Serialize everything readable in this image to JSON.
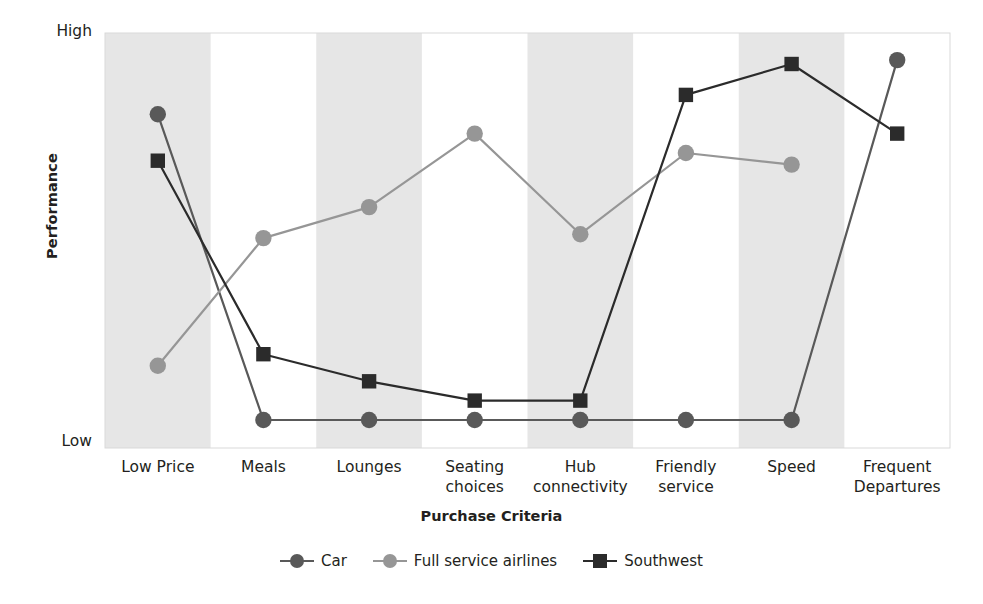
{
  "axes": {
    "ylabel": "Performance",
    "ytick_high": "High",
    "ytick_low": "Low",
    "xlabel": "Purchase Criteria"
  },
  "colors": {
    "car": "#595959",
    "full_service_airlines": "#969696",
    "southwest": "#2b2b2b",
    "band": "#e6e6e6",
    "background": "#ffffff",
    "text": "#231f20"
  },
  "legend": {
    "items": [
      {
        "label": "Car",
        "marker": "circle",
        "color": "#595959"
      },
      {
        "label": "Full service airlines",
        "marker": "circle",
        "color": "#969696"
      },
      {
        "label": "Southwest",
        "marker": "square",
        "color": "#2b2b2b"
      }
    ]
  },
  "chart_data": {
    "type": "line",
    "title": "",
    "xlabel": "Purchase Criteria",
    "ylabel": "Performance",
    "ylim": [
      0,
      1
    ],
    "ytick_labels": [
      "Low",
      "High"
    ],
    "grid": false,
    "legend_position": "bottom",
    "banded_background": true,
    "categories": [
      "Low Price",
      "Meals",
      "Lounges",
      "Seating\nchoices",
      "Hub\nconnectivity",
      "Friendly\nservice",
      "Speed",
      "Frequent\nDepartures"
    ],
    "series": [
      {
        "name": "Car",
        "marker": "circle",
        "color": "#595959",
        "values": [
          0.79,
          0.0,
          0.0,
          0.0,
          0.0,
          0.0,
          0.0,
          0.93
        ]
      },
      {
        "name": "Full service airlines",
        "marker": "circle",
        "color": "#969696",
        "values": [
          0.14,
          0.47,
          0.55,
          0.74,
          0.48,
          0.69,
          0.66,
          null
        ]
      },
      {
        "name": "Southwest",
        "marker": "square",
        "color": "#2b2b2b",
        "values": [
          0.67,
          0.17,
          0.1,
          0.05,
          0.05,
          0.84,
          0.92,
          0.74
        ]
      }
    ]
  }
}
